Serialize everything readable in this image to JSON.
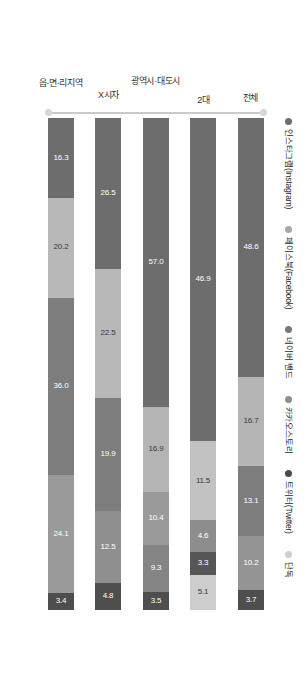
{
  "chart_data": {
    "type": "bar",
    "title": "",
    "subtitle": "",
    "xlabel": "",
    "ylabel": "",
    "orientation": "horizontal-stacked",
    "stacked": true,
    "grid": false,
    "legend_position": "top",
    "xlim": [
      0,
      100
    ],
    "categories": [
      "전체",
      "2대",
      "광역시·대도시",
      "X시자",
      "읍·면·리지역"
    ],
    "legend": [
      "인스타그램(Instagram)",
      "페이스북(Facebook)",
      "네이버 밴드",
      "카카오스토리",
      "트위터(Twitter)",
      "단독"
    ],
    "colors": [
      "#6d6d6d",
      "#a8a8a8",
      "#787878",
      "#8f8f8f",
      "#4a4a4a",
      "#cfcfcf"
    ],
    "series": [
      {
        "name": "인스타그램(Instagram)",
        "values": [
          48.6,
          46.9,
          57.0,
          26.5,
          16.3
        ]
      },
      {
        "name": "페이스북(Facebook)",
        "values": [
          16.7,
          11.5,
          16.9,
          22.5,
          20.2
        ]
      },
      {
        "name": "네이버 밴드",
        "values": [
          13.1,
          4.6,
          10.4,
          19.9,
          36.0
        ]
      },
      {
        "name": "카카오스토리",
        "values": [
          10.2,
          3.3,
          9.3,
          12.5,
          24.1
        ]
      },
      {
        "name": "트위터(Twitter)",
        "values": [
          3.7,
          5.1,
          3.5,
          4.8,
          3.4
        ]
      },
      {
        "name": "단독",
        "values": [
          0,
          0,
          0,
          0,
          0
        ]
      }
    ],
    "bars": [
      {
        "category": "전체",
        "segments": [
          {
            "series": "인스타그램(Instagram)",
            "value": 48.6,
            "label": "48.6",
            "color": "#6d6d6d",
            "light": false
          },
          {
            "series": "페이스북(Facebook)",
            "value": 16.7,
            "label": "16.7",
            "color": "#b4b4b4",
            "light": true
          },
          {
            "series": "네이버 밴드",
            "value": 13.1,
            "label": "13.1",
            "color": "#7d7d7d",
            "light": false
          },
          {
            "series": "카카오스토리",
            "value": 10.2,
            "label": "10.2",
            "color": "#949494",
            "light": false
          },
          {
            "series": "트위터(Twitter)",
            "value": 3.7,
            "label": "3.7",
            "color": "#4e4e4e",
            "light": false
          }
        ]
      },
      {
        "category": "2대",
        "segments": [
          {
            "series": "인스타그램(Instagram)",
            "value": 46.9,
            "label": "46.9",
            "color": "#6d6d6d",
            "light": false
          },
          {
            "series": "페이스북(Facebook)",
            "value": 11.5,
            "label": "11.5",
            "color": "#c2c2c2",
            "light": true
          },
          {
            "series": "네이버 밴드",
            "value": 4.6,
            "label": "4.6",
            "color": "#8d8d8d",
            "light": false
          },
          {
            "series": "카카오스토리",
            "value": 3.3,
            "label": "3.3",
            "color": "#565656",
            "light": false
          },
          {
            "series": "트위터(Twitter)",
            "value": 5.1,
            "label": "5.1",
            "color": "#cdcdcd",
            "light": true
          }
        ]
      },
      {
        "category": "광역시·대도시",
        "segments": [
          {
            "series": "인스타그램(Instagram)",
            "value": 57.0,
            "label": "57.0",
            "color": "#6d6d6d",
            "light": false
          },
          {
            "series": "페이스북(Facebook)",
            "value": 16.9,
            "label": "16.9",
            "color": "#b4b4b4",
            "light": true
          },
          {
            "series": "네이버 밴드",
            "value": 10.4,
            "label": "10.4",
            "color": "#9a9a9a",
            "light": false
          },
          {
            "series": "카카오스토리",
            "value": 9.3,
            "label": "9.3",
            "color": "#858585",
            "light": false
          },
          {
            "series": "트위터(Twitter)",
            "value": 3.5,
            "label": "3.5",
            "color": "#4e4e4e",
            "light": false
          }
        ]
      },
      {
        "category": "X시자",
        "segments": [
          {
            "series": "인스타그램(Instagram)",
            "value": 26.5,
            "label": "26.5",
            "color": "#6d6d6d",
            "light": false
          },
          {
            "series": "페이스북(Facebook)",
            "value": 22.5,
            "label": "22.5",
            "color": "#b8b8b8",
            "light": true
          },
          {
            "series": "네이버 밴드",
            "value": 19.9,
            "label": "19.9",
            "color": "#7d7d7d",
            "light": false
          },
          {
            "series": "카카오스토리",
            "value": 12.5,
            "label": "12.5",
            "color": "#8f8f8f",
            "light": false
          },
          {
            "series": "트위터(Twitter)",
            "value": 4.8,
            "label": "4.8",
            "color": "#4e4e4e",
            "light": false
          }
        ]
      },
      {
        "category": "읍·면·리지역",
        "segments": [
          {
            "series": "인스타그램(Instagram)",
            "value": 16.3,
            "label": "16.3",
            "color": "#6d6d6d",
            "light": false
          },
          {
            "series": "페이스북(Facebook)",
            "value": 20.2,
            "label": "20.2",
            "color": "#b8b8b8",
            "light": true
          },
          {
            "series": "네이버 밴드",
            "value": 36.0,
            "label": "36.0",
            "color": "#7d7d7d",
            "light": false
          },
          {
            "series": "카카오스토리",
            "value": 24.1,
            "label": "24.1",
            "color": "#9a9a9a",
            "light": false
          },
          {
            "series": "트위터(Twitter)",
            "value": 3.4,
            "label": "3.4",
            "color": "#4e4e4e",
            "light": false
          }
        ]
      }
    ]
  }
}
